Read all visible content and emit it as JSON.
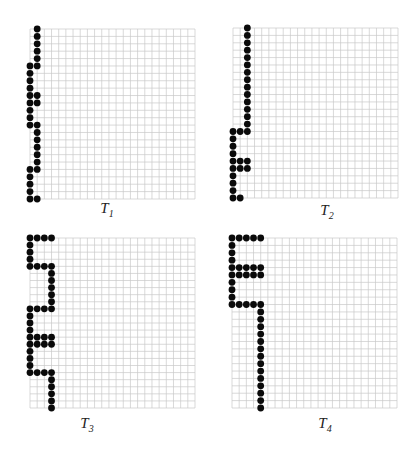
{
  "figure": {
    "panels": [
      {
        "id": "T1",
        "label_main": "T",
        "label_sub": "1",
        "grid_cols": 23,
        "grid_rows": 24,
        "dots": [
          [
            0,
            1
          ],
          [
            1,
            1
          ],
          [
            2,
            1
          ],
          [
            3,
            1
          ],
          [
            4,
            1
          ],
          [
            5,
            0
          ],
          [
            5,
            1
          ],
          [
            6,
            0
          ],
          [
            7,
            0
          ],
          [
            8,
            0
          ],
          [
            9,
            0
          ],
          [
            9,
            1
          ],
          [
            10,
            0
          ],
          [
            10,
            1
          ],
          [
            11,
            0
          ],
          [
            12,
            0
          ],
          [
            13,
            0
          ],
          [
            13,
            1
          ],
          [
            14,
            1
          ],
          [
            15,
            1
          ],
          [
            16,
            1
          ],
          [
            17,
            1
          ],
          [
            18,
            1
          ],
          [
            19,
            0
          ],
          [
            19,
            1
          ],
          [
            20,
            0
          ],
          [
            21,
            0
          ],
          [
            22,
            0
          ],
          [
            23,
            0
          ],
          [
            23,
            1
          ]
        ]
      },
      {
        "id": "T2",
        "label_main": "T",
        "label_sub": "2",
        "grid_cols": 23,
        "grid_rows": 24,
        "dots": [
          [
            0,
            2
          ],
          [
            1,
            2
          ],
          [
            2,
            2
          ],
          [
            3,
            2
          ],
          [
            4,
            2
          ],
          [
            5,
            2
          ],
          [
            6,
            2
          ],
          [
            7,
            2
          ],
          [
            8,
            2
          ],
          [
            9,
            2
          ],
          [
            10,
            2
          ],
          [
            11,
            2
          ],
          [
            12,
            2
          ],
          [
            13,
            2
          ],
          [
            14,
            0
          ],
          [
            14,
            1
          ],
          [
            14,
            2
          ],
          [
            15,
            0
          ],
          [
            16,
            0
          ],
          [
            17,
            0
          ],
          [
            18,
            0
          ],
          [
            18,
            1
          ],
          [
            18,
            2
          ],
          [
            19,
            0
          ],
          [
            19,
            1
          ],
          [
            19,
            2
          ],
          [
            20,
            0
          ],
          [
            21,
            0
          ],
          [
            22,
            0
          ],
          [
            23,
            0
          ],
          [
            23,
            1
          ]
        ]
      },
      {
        "id": "T3",
        "label_main": "T",
        "label_sub": "3",
        "grid_cols": 23,
        "grid_rows": 25,
        "dots": [
          [
            0,
            0
          ],
          [
            0,
            1
          ],
          [
            0,
            2
          ],
          [
            0,
            3
          ],
          [
            1,
            0
          ],
          [
            2,
            0
          ],
          [
            3,
            0
          ],
          [
            4,
            0
          ],
          [
            4,
            1
          ],
          [
            4,
            2
          ],
          [
            4,
            3
          ],
          [
            5,
            3
          ],
          [
            6,
            3
          ],
          [
            7,
            3
          ],
          [
            8,
            3
          ],
          [
            9,
            3
          ],
          [
            10,
            0
          ],
          [
            10,
            1
          ],
          [
            10,
            2
          ],
          [
            10,
            3
          ],
          [
            11,
            0
          ],
          [
            12,
            0
          ],
          [
            13,
            0
          ],
          [
            14,
            0
          ],
          [
            14,
            1
          ],
          [
            14,
            2
          ],
          [
            14,
            3
          ],
          [
            15,
            0
          ],
          [
            15,
            1
          ],
          [
            15,
            2
          ],
          [
            15,
            3
          ],
          [
            16,
            0
          ],
          [
            17,
            0
          ],
          [
            18,
            0
          ],
          [
            19,
            0
          ],
          [
            19,
            1
          ],
          [
            19,
            2
          ],
          [
            19,
            3
          ],
          [
            20,
            3
          ],
          [
            21,
            3
          ],
          [
            22,
            3
          ],
          [
            23,
            3
          ],
          [
            24,
            3
          ]
        ]
      },
      {
        "id": "T4",
        "label_main": "T",
        "label_sub": "4",
        "grid_cols": 23,
        "grid_rows": 24,
        "dots": [
          [
            0,
            0
          ],
          [
            0,
            1
          ],
          [
            0,
            2
          ],
          [
            0,
            3
          ],
          [
            0,
            4
          ],
          [
            1,
            0
          ],
          [
            2,
            0
          ],
          [
            3,
            0
          ],
          [
            4,
            0
          ],
          [
            4,
            1
          ],
          [
            4,
            2
          ],
          [
            4,
            3
          ],
          [
            4,
            4
          ],
          [
            5,
            0
          ],
          [
            5,
            1
          ],
          [
            5,
            2
          ],
          [
            5,
            3
          ],
          [
            5,
            4
          ],
          [
            6,
            0
          ],
          [
            7,
            0
          ],
          [
            8,
            0
          ],
          [
            9,
            0
          ],
          [
            9,
            1
          ],
          [
            9,
            2
          ],
          [
            9,
            3
          ],
          [
            9,
            4
          ],
          [
            10,
            4
          ],
          [
            11,
            4
          ],
          [
            12,
            4
          ],
          [
            13,
            4
          ],
          [
            14,
            4
          ],
          [
            15,
            4
          ],
          [
            16,
            4
          ],
          [
            17,
            4
          ],
          [
            18,
            4
          ],
          [
            19,
            4
          ],
          [
            20,
            4
          ],
          [
            21,
            4
          ],
          [
            22,
            4
          ],
          [
            23,
            4
          ]
        ]
      }
    ]
  }
}
